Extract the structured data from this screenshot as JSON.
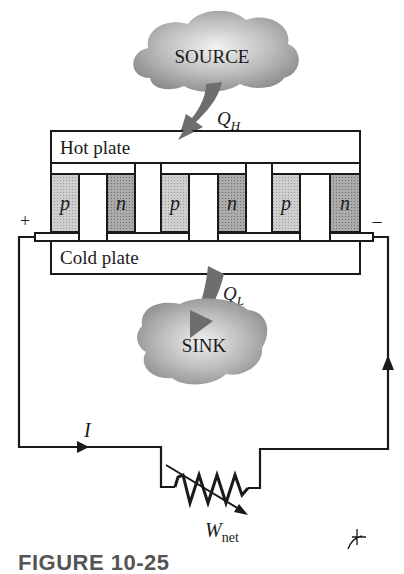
{
  "figure": {
    "caption": "FIGURE 10-25",
    "source_label": "SOURCE",
    "sink_label": "SINK",
    "hot_plate_label": "Hot plate",
    "cold_plate_label": "Cold plate",
    "heat_in": {
      "symbol": "Q",
      "subscript": "H"
    },
    "heat_out": {
      "symbol": "Q",
      "subscript": "L"
    },
    "work": {
      "symbol": "W",
      "subscript": "net"
    },
    "current_label": "I",
    "terminal_positive": "+",
    "terminal_negative": "–",
    "elements": [
      {
        "type": "p"
      },
      {
        "type": "n"
      },
      {
        "type": "p"
      },
      {
        "type": "n"
      },
      {
        "type": "p"
      },
      {
        "type": "n"
      }
    ],
    "colors": {
      "line": "#1a1a1a",
      "p_fill": "#c9c9c9",
      "n_fill": "#a9a9a9",
      "arrow_fill": "#6e6e6e",
      "cloud_light": "#eeeeee",
      "cloud_dark": "#8c8c8c"
    }
  }
}
